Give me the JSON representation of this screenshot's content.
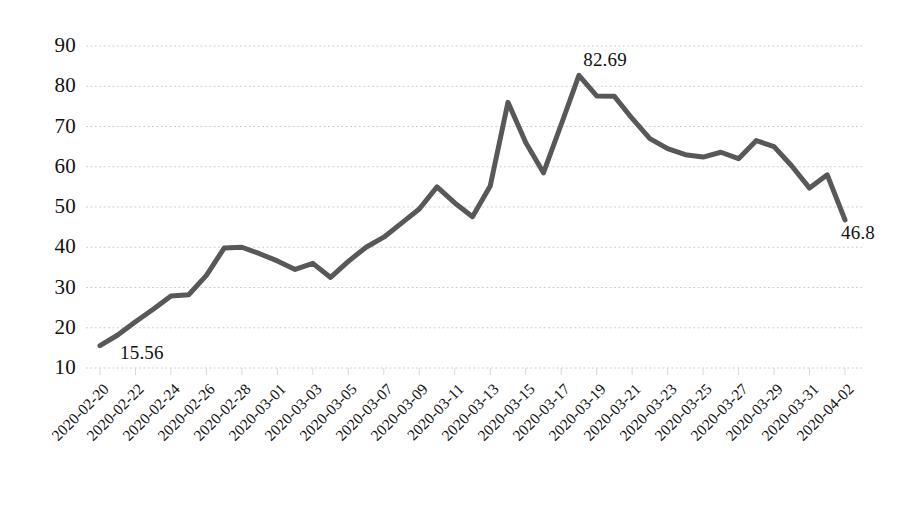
{
  "chart_data": {
    "type": "line",
    "title": "",
    "subtitle": "",
    "xlabel": "",
    "ylabel": "",
    "grid": true,
    "legend": null,
    "ylim": [
      10,
      90
    ],
    "yticks": [
      10,
      20,
      30,
      40,
      50,
      60,
      70,
      80,
      90
    ],
    "ytick_labels": [
      "10",
      "20",
      "30",
      "40",
      "50",
      "60",
      "70",
      "80",
      "90"
    ],
    "xtick_labels": [
      "2020-02-20",
      "2020-02-22",
      "2020-02-24",
      "2020-02-26",
      "2020-02-28",
      "2020-03-01",
      "2020-03-03",
      "2020-03-05",
      "2020-03-07",
      "2020-03-09",
      "2020-03-11",
      "2020-03-13",
      "2020-03-15",
      "2020-03-17",
      "2020-03-19",
      "2020-03-21",
      "2020-03-23",
      "2020-03-25",
      "2020-03-27",
      "2020-03-29",
      "2020-03-31",
      "2020-04-02"
    ],
    "xtick_rotation": -45,
    "x": [
      "2020-02-20",
      "2020-02-21",
      "2020-02-22",
      "2020-02-23",
      "2020-02-24",
      "2020-02-25",
      "2020-02-26",
      "2020-02-27",
      "2020-02-28",
      "2020-02-29",
      "2020-03-01",
      "2020-03-02",
      "2020-03-03",
      "2020-03-04",
      "2020-03-05",
      "2020-03-06",
      "2020-03-07",
      "2020-03-08",
      "2020-03-09",
      "2020-03-10",
      "2020-03-11",
      "2020-03-12",
      "2020-03-13",
      "2020-03-14",
      "2020-03-15",
      "2020-03-16",
      "2020-03-17",
      "2020-03-18",
      "2020-03-19",
      "2020-03-20",
      "2020-03-21",
      "2020-03-22",
      "2020-03-23",
      "2020-03-24",
      "2020-03-25",
      "2020-03-26",
      "2020-03-27",
      "2020-03-28",
      "2020-03-29",
      "2020-03-30",
      "2020-03-31",
      "2020-04-01",
      "2020-04-02"
    ],
    "values": [
      15.56,
      18.2,
      21.5,
      24.6,
      27.9,
      28.2,
      33.0,
      39.8,
      40.0,
      38.4,
      36.6,
      34.5,
      36.0,
      32.5,
      36.5,
      40.0,
      42.5,
      46.0,
      49.5,
      55.0,
      51.0,
      47.6,
      55.2,
      76.0,
      66.0,
      58.5,
      70.5,
      82.69,
      77.6,
      77.5,
      72.0,
      67.0,
      64.5,
      63.0,
      62.4,
      63.6,
      62.0,
      66.5,
      65.0,
      60.2,
      54.7,
      58.0,
      46.8
    ],
    "series_color": "#58585a",
    "line_width": 5,
    "gridline_color": "#cfcfd4",
    "gridline_style": "dotted",
    "point_labels": [
      {
        "text": "15.56",
        "x": "2020-02-20",
        "value": 15.56
      },
      {
        "text": "82.69",
        "x": "2020-03-17",
        "value": 82.69
      },
      {
        "text": "46.8",
        "x": "2020-04-02",
        "value": 46.8
      }
    ]
  },
  "axes": {
    "y_axis_name": "value-axis",
    "x_axis_name": "date-axis"
  }
}
